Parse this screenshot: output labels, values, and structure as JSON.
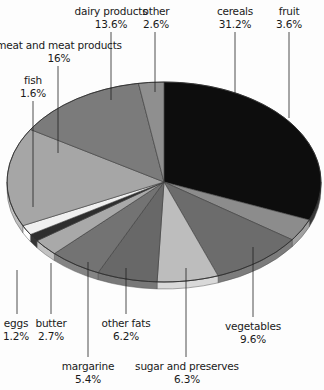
{
  "chart_data": {
    "type": "pie",
    "title": "",
    "style": "3d-elliptical",
    "start_angle_deg": 0,
    "direction": "clockwise",
    "slices": [
      {
        "label": "cereals",
        "value": 31.2,
        "display": "31.2%",
        "color": "#0d0d0d"
      },
      {
        "label": "fruit",
        "value": 3.6,
        "display": "3.6%",
        "color": "#8c8c8c"
      },
      {
        "label": "vegetables",
        "value": 9.6,
        "display": "9.6%",
        "color": "#6c6c6c"
      },
      {
        "label": "sugar and preserves",
        "value": 6.3,
        "display": "6.3%",
        "color": "#bdbdbd"
      },
      {
        "label": "other fats",
        "value": 6.2,
        "display": "6.2%",
        "color": "#686868"
      },
      {
        "label": "margarine",
        "value": 5.4,
        "display": "5.4%",
        "color": "#737373"
      },
      {
        "label": "butter",
        "value": 2.7,
        "display": "2.7%",
        "color": "#a9a9a9"
      },
      {
        "label": "eggs",
        "value": 1.2,
        "display": "1.2%",
        "color": "#2e2e2e"
      },
      {
        "label": "fish",
        "value": 1.6,
        "display": "1.6%",
        "color": "#f0f0f0"
      },
      {
        "label": "meat and meat products",
        "value": 16,
        "display": "16%",
        "color": "#a6a6a6"
      },
      {
        "label": "dairy products",
        "value": 13.6,
        "display": "13.6%",
        "color": "#7b7b7b"
      },
      {
        "label": "other",
        "value": 2.6,
        "display": "2.6%",
        "color": "#8f8f8f"
      }
    ]
  },
  "labels": [
    {
      "name": "cereals",
      "pct": "31.2%",
      "x": 235,
      "y": 5,
      "lx": 235,
      "ly1": 32,
      "ly2": 93
    },
    {
      "name": "fruit",
      "pct": "3.6%",
      "x": 289,
      "y": 5,
      "lx": 289,
      "ly1": 32,
      "ly2": 118
    },
    {
      "name": "dairy products",
      "pct": "13.6%",
      "x": 111,
      "y": 5,
      "lx": 111,
      "ly1": 32,
      "ly2": 100
    },
    {
      "name": "other",
      "pct": "2.6%",
      "x": 156,
      "y": 5,
      "lx": 155,
      "ly1": 32,
      "ly2": 92
    },
    {
      "name": "meat and meat products",
      "pct": "16%",
      "x": 59,
      "y": 39,
      "lx": 58,
      "ly1": 66,
      "ly2": 153
    },
    {
      "name": "fish",
      "pct": "1.6%",
      "x": 33,
      "y": 74,
      "lx": 33,
      "ly1": 101,
      "ly2": 207
    },
    {
      "name": "eggs",
      "pct": "1.2%",
      "x": 16,
      "y": 317,
      "lx": 17,
      "ly1": 270,
      "ly2": 314
    },
    {
      "name": "butter",
      "pct": "2.7%",
      "x": 51,
      "y": 317,
      "lx": 51,
      "ly1": 263,
      "ly2": 314
    },
    {
      "name": "other fats",
      "pct": "6.2%",
      "x": 126,
      "y": 317,
      "lx": 126,
      "ly1": 268,
      "ly2": 314
    },
    {
      "name": "margarine",
      "pct": "5.4%",
      "x": 88,
      "y": 360,
      "lx": 88,
      "ly1": 262,
      "ly2": 357
    },
    {
      "name": "sugar and preserves",
      "pct": "6.3%",
      "x": 187,
      "y": 360,
      "lx": 186,
      "ly1": 268,
      "ly2": 357
    },
    {
      "name": "vegetables",
      "pct": "9.6%",
      "x": 253,
      "y": 320,
      "lx": 253,
      "ly1": 247,
      "ly2": 317
    }
  ]
}
